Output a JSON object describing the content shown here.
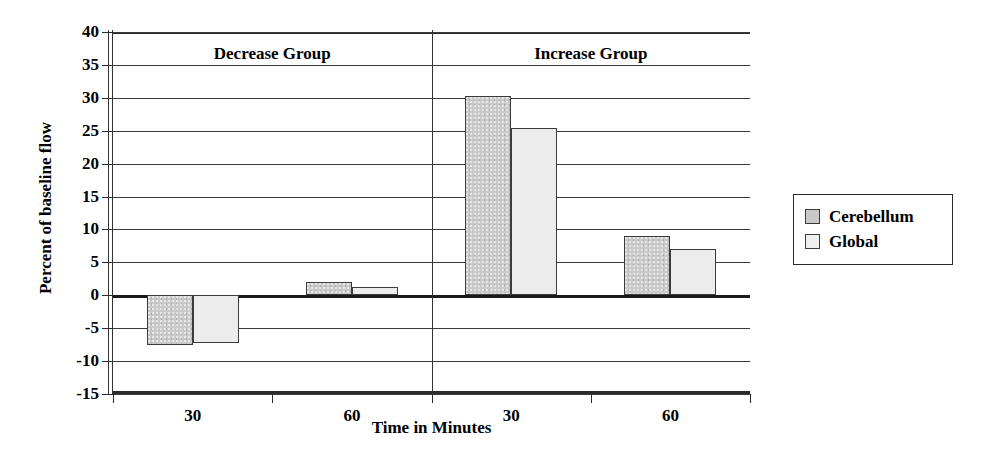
{
  "chart_data": {
    "type": "bar",
    "title": "",
    "xlabel": "Time in Minutes",
    "ylabel": "Percent of baseline flow",
    "ylim": [
      -15,
      40
    ],
    "ytick_step": 5,
    "yticks": [
      40,
      35,
      30,
      25,
      20,
      15,
      10,
      5,
      0,
      -5,
      -10,
      -15
    ],
    "ytick_labels": [
      "40",
      "35",
      "30",
      "25",
      "20",
      "15",
      "10",
      "5",
      "0",
      "-5",
      "-10",
      "-15"
    ],
    "grid": true,
    "legend_position": "right",
    "groups": [
      "Decrease Group",
      "Increase Group"
    ],
    "categories": [
      "30",
      "60",
      "30",
      "60"
    ],
    "category_groups": [
      "Decrease Group",
      "Decrease Group",
      "Increase Group",
      "Increase Group"
    ],
    "series": [
      {
        "name": "Cerebellum",
        "color": "#c9c9c9",
        "values": [
          -7.6,
          2.0,
          30.3,
          9.0
        ]
      },
      {
        "name": "Global",
        "color": "#ececec",
        "values": [
          -7.3,
          1.3,
          25.4,
          7.0
        ]
      }
    ],
    "annotations": []
  },
  "axes": {
    "y_title": "Percent of baseline flow",
    "x_title": "Time in Minutes",
    "y_tick_labels": [
      "40",
      "35",
      "30",
      "25",
      "20",
      "15",
      "10",
      "5",
      "0",
      "-5",
      "-10",
      "-15"
    ],
    "x_tick_labels": [
      "30",
      "60",
      "30",
      "60"
    ]
  },
  "group_titles": [
    {
      "label": "Decrease Group"
    },
    {
      "label": "Increase Group"
    }
  ],
  "legend": {
    "items": [
      {
        "label": "Cerebellum",
        "swatch": "cerebellum-swatch"
      },
      {
        "label": "Global",
        "swatch": "global-swatch"
      }
    ]
  }
}
